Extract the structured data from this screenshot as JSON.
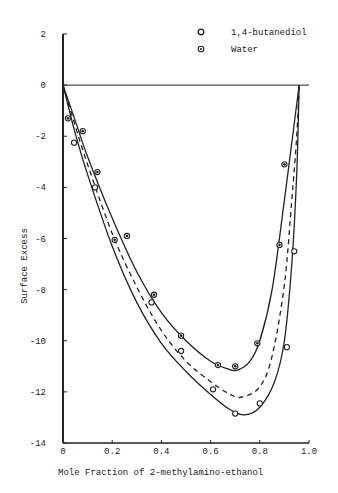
{
  "chart_data": {
    "type": "scatter",
    "title": "",
    "xlabel": "Mole Fraction of 2-methylamino-ethanol",
    "ylabel": "Surface Excess",
    "xlim": [
      0,
      1.0
    ],
    "ylim": [
      -14,
      2
    ],
    "grid": false,
    "legend_position": "top-right",
    "x_ticks": [
      "0",
      "0.2",
      "0.4",
      "0.6",
      "0.8",
      "1.0"
    ],
    "y_ticks": [
      "2",
      "0",
      "-2",
      "-4",
      "-6",
      "-8",
      "-10",
      "-12",
      "-14"
    ],
    "reference_line": {
      "y": 0,
      "label": "zero line"
    },
    "series": [
      {
        "name": "1,4-butanediol",
        "marker": "open-circle",
        "points": [
          {
            "x": 0.045,
            "y": -2.25
          },
          {
            "x": 0.13,
            "y": -4.0
          },
          {
            "x": 0.36,
            "y": -8.5
          },
          {
            "x": 0.48,
            "y": -10.4
          },
          {
            "x": 0.61,
            "y": -11.9
          },
          {
            "x": 0.7,
            "y": -12.85
          },
          {
            "x": 0.8,
            "y": -12.45
          },
          {
            "x": 0.91,
            "y": -10.25
          },
          {
            "x": 0.94,
            "y": -6.5
          }
        ]
      },
      {
        "name": "Water",
        "marker": "dotted-circle",
        "points": [
          {
            "x": 0.02,
            "y": -1.3
          },
          {
            "x": 0.08,
            "y": -1.8
          },
          {
            "x": 0.14,
            "y": -3.4
          },
          {
            "x": 0.21,
            "y": -6.05
          },
          {
            "x": 0.26,
            "y": -5.9
          },
          {
            "x": 0.37,
            "y": -8.2
          },
          {
            "x": 0.48,
            "y": -9.8
          },
          {
            "x": 0.63,
            "y": -10.95
          },
          {
            "x": 0.7,
            "y": -11.0
          },
          {
            "x": 0.79,
            "y": -10.1
          },
          {
            "x": 0.88,
            "y": -6.25
          },
          {
            "x": 0.9,
            "y": -3.1
          }
        ]
      }
    ],
    "curves": [
      {
        "name": "upper fit",
        "style": "solid",
        "points": [
          [
            0,
            0
          ],
          [
            0.05,
            -1.4
          ],
          [
            0.1,
            -2.8
          ],
          [
            0.2,
            -5.2
          ],
          [
            0.3,
            -7.3
          ],
          [
            0.4,
            -8.9
          ],
          [
            0.5,
            -10.0
          ],
          [
            0.6,
            -10.8
          ],
          [
            0.67,
            -11.1
          ],
          [
            0.71,
            -11.15
          ],
          [
            0.76,
            -10.8
          ],
          [
            0.8,
            -10.0
          ],
          [
            0.85,
            -8.0
          ],
          [
            0.9,
            -4.5
          ],
          [
            0.94,
            -1.5
          ],
          [
            0.96,
            0
          ]
        ]
      },
      {
        "name": "middle fit",
        "style": "dashed",
        "points": [
          [
            0,
            0
          ],
          [
            0.05,
            -1.6
          ],
          [
            0.1,
            -3.1
          ],
          [
            0.2,
            -5.8
          ],
          [
            0.3,
            -7.9
          ],
          [
            0.4,
            -9.6
          ],
          [
            0.5,
            -10.8
          ],
          [
            0.6,
            -11.6
          ],
          [
            0.68,
            -12.1
          ],
          [
            0.73,
            -12.2
          ],
          [
            0.8,
            -11.8
          ],
          [
            0.85,
            -10.6
          ],
          [
            0.9,
            -7.8
          ],
          [
            0.93,
            -4.5
          ],
          [
            0.95,
            -2.0
          ],
          [
            0.96,
            0
          ]
        ]
      },
      {
        "name": "lower fit",
        "style": "solid",
        "points": [
          [
            0,
            0
          ],
          [
            0.05,
            -1.9
          ],
          [
            0.1,
            -3.5
          ],
          [
            0.2,
            -6.3
          ],
          [
            0.3,
            -8.5
          ],
          [
            0.4,
            -10.1
          ],
          [
            0.5,
            -11.2
          ],
          [
            0.6,
            -12.1
          ],
          [
            0.68,
            -12.7
          ],
          [
            0.74,
            -12.9
          ],
          [
            0.8,
            -12.6
          ],
          [
            0.86,
            -11.6
          ],
          [
            0.9,
            -10.0
          ],
          [
            0.93,
            -7.0
          ],
          [
            0.95,
            -3.5
          ],
          [
            0.96,
            0
          ]
        ]
      }
    ]
  },
  "legend": {
    "items": [
      {
        "label": "1,4-butanediol",
        "marker": "open-circle"
      },
      {
        "label": "Water",
        "marker": "dotted-circle"
      }
    ]
  },
  "axes": {
    "xlabel": "Mole Fraction of 2-methylamino-ethanol",
    "ylabel": "Surface Excess"
  }
}
